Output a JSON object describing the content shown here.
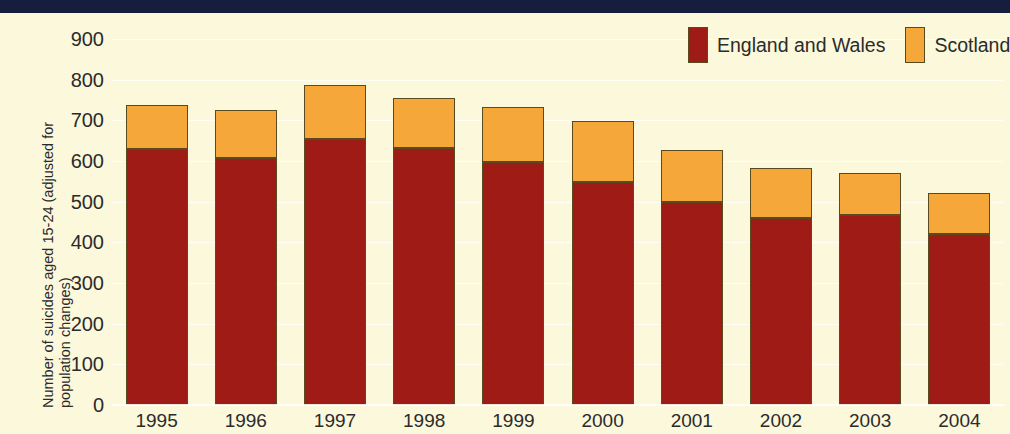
{
  "header": {
    "bar_color": "#151f3d"
  },
  "theme": {
    "background": "#fbf8dc",
    "series_colors": [
      "#9e1b16",
      "#f5a839"
    ],
    "outline": "#5a4a20",
    "text": "#2b2b2b"
  },
  "legend": {
    "items": [
      {
        "label": "England and Wales",
        "color": "#9e1b16"
      },
      {
        "label": "Scotland",
        "color": "#f5a839"
      }
    ]
  },
  "chart_data": {
    "type": "bar",
    "stacked": true,
    "title": "",
    "xlabel": "",
    "ylabel": "Number of suicides aged 15-24 (adjusted for population changes)",
    "categories": [
      "1995",
      "1996",
      "1997",
      "1998",
      "1999",
      "2000",
      "2001",
      "2002",
      "2003",
      "2004"
    ],
    "ylim": [
      0,
      900
    ],
    "yticks": [
      0,
      100,
      200,
      300,
      400,
      500,
      600,
      700,
      800,
      900
    ],
    "ytick_labels": [
      "0",
      "100",
      "200",
      "300",
      "400",
      "500",
      "600",
      "700",
      "800",
      "900"
    ],
    "grid": true,
    "legend_position": "top-right",
    "series": [
      {
        "name": "England and Wales",
        "color": "#9e1b16",
        "values": [
          630,
          608,
          655,
          632,
          597,
          548,
          500,
          460,
          468,
          420
        ]
      },
      {
        "name": "Scotland",
        "color": "#f5a839",
        "values": [
          108,
          118,
          133,
          122,
          135,
          150,
          128,
          123,
          102,
          102
        ]
      }
    ],
    "totals": [
      738,
      726,
      788,
      754,
      732,
      698,
      628,
      583,
      570,
      522
    ]
  }
}
